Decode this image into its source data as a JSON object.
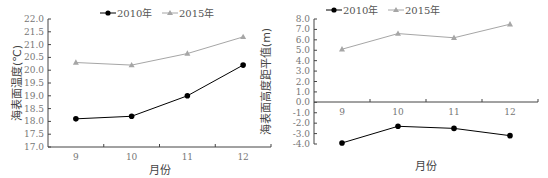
{
  "chart_data": [
    {
      "type": "line",
      "title": "",
      "xlabel": "月份",
      "ylabel": "海表面温度(℃)",
      "categories": [
        "9",
        "10",
        "11",
        "12"
      ],
      "ylim": [
        17.0,
        22.0
      ],
      "yticks": [
        "22.0",
        "21.5",
        "21.0",
        "20.5",
        "20.0",
        "19.5",
        "19.0",
        "18.5",
        "18.0",
        "17.5",
        "17.0"
      ],
      "grid": false,
      "legend_position": "top-center",
      "series": [
        {
          "name": "2010年",
          "values": [
            18.1,
            18.2,
            19.0,
            20.2
          ],
          "color": "#000000",
          "marker": "diamond"
        },
        {
          "name": "2015年",
          "values": [
            20.3,
            20.2,
            20.65,
            21.3
          ],
          "color": "#a6a6a6",
          "marker": "triangle"
        }
      ]
    },
    {
      "type": "line",
      "title": "",
      "xlabel": "月份",
      "ylabel": "海表面高度距平值(m)",
      "categories": [
        "9",
        "10",
        "11",
        "12"
      ],
      "ylim": [
        -4.0,
        8.0
      ],
      "yticks": [
        "8.0",
        "7.0",
        "6.0",
        "5.0",
        "4.0",
        "3.0",
        "2.0",
        "1.0",
        "0.0",
        "-1.0",
        "-2.0",
        "-3.0",
        "-4.0"
      ],
      "grid": false,
      "legend_position": "top-center",
      "series": [
        {
          "name": "2010年",
          "values": [
            -3.9,
            -2.3,
            -2.5,
            -3.2
          ],
          "color": "#000000",
          "marker": "diamond"
        },
        {
          "name": "2015年",
          "values": [
            5.1,
            6.6,
            6.2,
            7.5
          ],
          "color": "#a6a6a6",
          "marker": "triangle"
        }
      ]
    }
  ]
}
